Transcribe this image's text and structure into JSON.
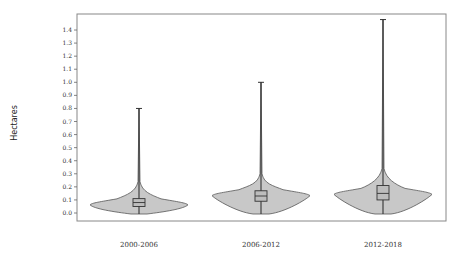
{
  "chart_data": {
    "type": "violin",
    "title": "",
    "xlabel": "",
    "ylabel": "Hectares",
    "ylim": [
      0,
      1.48
    ],
    "yticks": [
      0.0,
      0.1,
      0.2,
      0.3,
      0.4,
      0.5,
      0.6,
      0.7,
      0.8,
      0.9,
      1.0,
      1.1,
      1.2,
      1.3,
      1.4
    ],
    "ytick_labels": [
      "0.0",
      "0.1",
      "0.2",
      "0.3",
      "0.4",
      "0.5",
      "0.6",
      "0.7",
      "0.8",
      "0.9",
      "1.0",
      "1.1",
      "1.2",
      "1.3",
      "1.4"
    ],
    "grid": false,
    "legend": null,
    "categories": [
      "2000-2006",
      "2006-2012",
      "2012-2018"
    ],
    "series": [
      {
        "name": "2000-2006",
        "min": 0.0,
        "q1": 0.05,
        "median": 0.08,
        "q3": 0.11,
        "max": 0.8,
        "mode": 0.07
      },
      {
        "name": "2006-2012",
        "min": 0.0,
        "q1": 0.09,
        "median": 0.13,
        "q3": 0.17,
        "max": 1.0,
        "mode": 0.14
      },
      {
        "name": "2012-2018",
        "min": 0.0,
        "q1": 0.1,
        "median": 0.15,
        "q3": 0.21,
        "max": 1.48,
        "mode": 0.15
      }
    ],
    "colors": {
      "violin_fill": "#c8c8c8",
      "outline": "#555555",
      "frame": "#888888"
    }
  }
}
